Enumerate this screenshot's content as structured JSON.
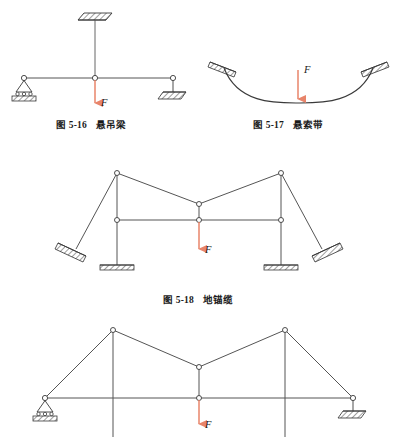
{
  "page": {
    "background": "#ffffff",
    "width": 397,
    "height": 437,
    "type": "textbook-figure-plate"
  },
  "colors": {
    "line": "#3a3a3a",
    "member": "#555555",
    "load_arrow": "#e8846a",
    "hatch": "#4a4a4a",
    "text": "#1a1a1a",
    "node_fill": "#ffffff"
  },
  "figures": [
    {
      "id": "fig-5-16",
      "number": "图 5-16",
      "title": "悬吊梁",
      "caption": "图 5-16   悬吊梁",
      "load_label": "F",
      "description": "horizontal beam suspended by a central hanger from a hatched ceiling, pinned support at left, link support at right, downward point load F at midspan"
    },
    {
      "id": "fig-5-17",
      "number": "图 5-17",
      "title": "悬索带",
      "caption": "图 5-17   悬索带",
      "load_label": "F",
      "description": "catenary suspension cable anchored to two inclined hatched supports, downward point load F at the lowest point"
    },
    {
      "id": "fig-5-18",
      "number": "图 5-18",
      "title": "地锚缆",
      "caption": "图 5-18   地锚缆",
      "load_label": "F",
      "description": "two masts on hatched footings with inclined guy cables to ground anchors, horizontal tie beam, suspended cable carrying downward load F at centre"
    },
    {
      "id": "fig-5-19",
      "number": "",
      "title": "",
      "caption": "",
      "load_label": "F",
      "description": "cable-stayed framework with two masts, inclined stays to pinned support at left and link support at right, horizontal deck beam, downward load F at centre; figure is cropped at the bottom edge of the page"
    }
  ],
  "labels": {
    "load": "F"
  }
}
